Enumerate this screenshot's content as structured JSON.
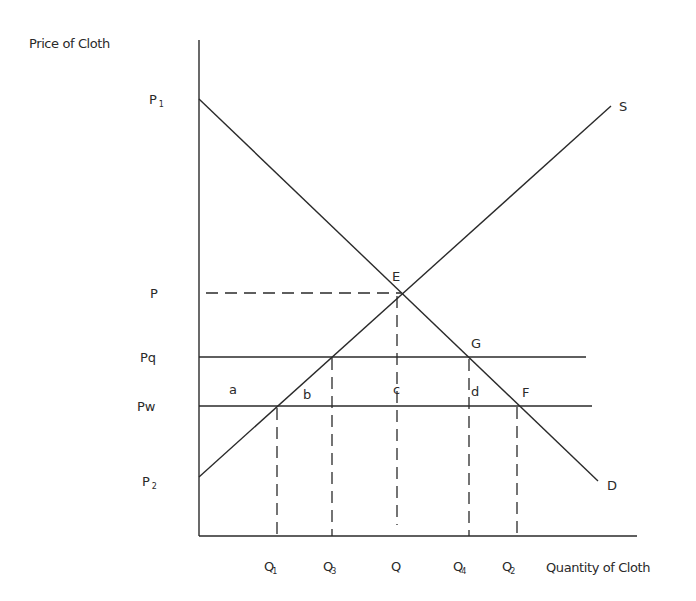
{
  "axes": {
    "y_title": "Price of Cloth",
    "x_title": "Quantity of Cloth"
  },
  "price_labels": {
    "p1": {
      "main": "P",
      "sub": "1"
    },
    "p": "P",
    "pq": "Pq",
    "pw": "Pw",
    "p2": {
      "main": "P",
      "sub": "2"
    }
  },
  "quantity_labels": {
    "q1": {
      "main": "Q",
      "sub": "1"
    },
    "q3": {
      "main": "Q",
      "sub": "3"
    },
    "q": "Q",
    "q4": {
      "main": "Q",
      "sub": "4"
    },
    "q2": {
      "main": "Q",
      "sub": "2"
    }
  },
  "curves": {
    "supply": "S",
    "demand": "D"
  },
  "points": {
    "e": "E",
    "g": "G",
    "f": "F"
  },
  "areas": {
    "a": "a",
    "b": "b",
    "c": "c",
    "d": "d"
  }
}
